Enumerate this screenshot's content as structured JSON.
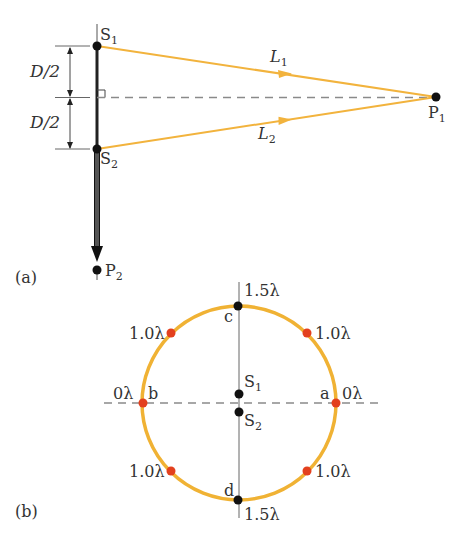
{
  "colors": {
    "path": "#F2B33D",
    "circle": "#F0B234",
    "red_point": "#E3401E",
    "ink": "#111111",
    "dash": "#8a8a8a",
    "text": "#333333"
  },
  "panel_a": {
    "label": "(a)",
    "sources": [
      {
        "name": "S",
        "sub": "1"
      },
      {
        "name": "S",
        "sub": "2"
      }
    ],
    "points": [
      {
        "name": "P",
        "sub": "1"
      },
      {
        "name": "P",
        "sub": "2"
      }
    ],
    "paths": [
      {
        "name": "L",
        "sub": "1"
      },
      {
        "name": "L",
        "sub": "2"
      }
    ],
    "dimensions": [
      "D/2",
      "D/2"
    ]
  },
  "panel_b": {
    "label": "(b)",
    "sources": [
      {
        "name": "S",
        "sub": "1"
      },
      {
        "name": "S",
        "sub": "2"
      }
    ],
    "points": [
      "a",
      "b",
      "c",
      "d"
    ],
    "path_difference_labels": {
      "top": "1.5λ",
      "bottom": "1.5λ",
      "left": "0λ",
      "right": "0λ",
      "upper_left": "1.0λ",
      "upper_right": "1.0λ",
      "lower_left": "1.0λ",
      "lower_right": "1.0λ"
    }
  }
}
